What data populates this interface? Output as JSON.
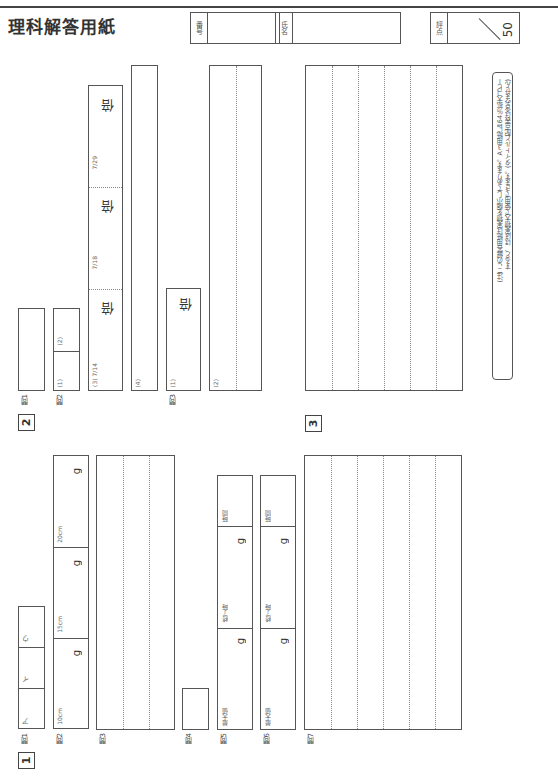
{
  "header": {
    "cut_text": "— 科 — 解 答 用 紙",
    "title": "理科解答用紙",
    "number_label": "番号",
    "name_label": "氏名",
    "score_label": "評点",
    "score_max": "50"
  },
  "note": {
    "line1": "(注) この解答用紙は実物を縮小してあります。A３用紙に164％拡大コピー",
    "line2": "すると、ほぼ実物大で使用できます。(タイトルと配点表は含みません)"
  },
  "sections": {
    "s1": {
      "number": "1",
      "q1": {
        "label": "問1",
        "cells": [
          "ア",
          "イ",
          "ウ"
        ]
      },
      "q2": {
        "label": "問2",
        "cells": [
          "10cm",
          "15cm",
          "20cm"
        ],
        "unit": "g"
      },
      "q3": {
        "label": "問3"
      },
      "q4": {
        "label": "問4"
      },
      "q5": {
        "label": "問5",
        "cells": [
          "最大値",
          "終了時",
          "時間"
        ],
        "unit": "g"
      },
      "q6": {
        "label": "問6",
        "cells": [
          "最大値",
          "終了時",
          "時間"
        ],
        "unit": "g"
      },
      "q7": {
        "label": "問7"
      }
    },
    "s2": {
      "number": "2",
      "q1": {
        "label": "問1"
      },
      "q2": {
        "label": "問2",
        "sub1": "(1)",
        "sub2": "(2)",
        "sub3": "(3) 7/14",
        "sub3b": "7/18",
        "sub3c": "7/29",
        "sub4": "(4)",
        "unit": "倍"
      },
      "q3": {
        "label": "問3",
        "sub1": "(1)",
        "sub2": "(2)",
        "unit": "倍"
      }
    },
    "s3": {
      "number": "3"
    }
  }
}
